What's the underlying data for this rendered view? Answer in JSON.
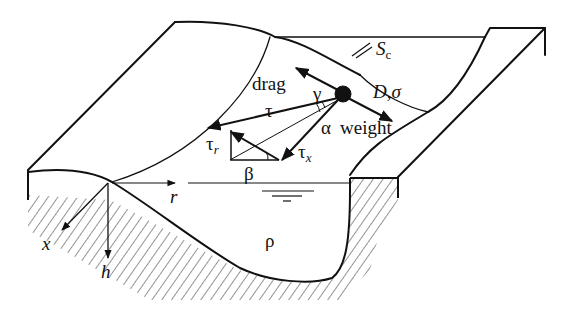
{
  "diagram": {
    "labels": {
      "slope": "S",
      "slope_sub": "c",
      "grain": "D,σ",
      "drag": "drag",
      "gamma": "γ",
      "tau": "τ",
      "alpha": "α",
      "weight": "weight",
      "tau_r": "τ",
      "tau_r_sub": "r",
      "tau_x": "τ",
      "tau_x_sub": "x",
      "beta": "β",
      "r_axis": "r",
      "x_axis": "x",
      "h_axis": "h",
      "rho": "ρ"
    },
    "colors": {
      "ink": "#111111",
      "background": "#ffffff"
    }
  }
}
